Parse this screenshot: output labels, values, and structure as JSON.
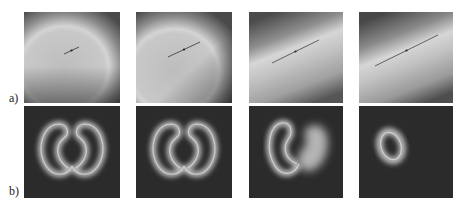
{
  "figure": {
    "rows": [
      {
        "label": "a)",
        "description": "grayscale intensity fields with diagonal bright band and centered line segment",
        "panels": [
          {
            "index": 1,
            "line_length": "short"
          },
          {
            "index": 2,
            "line_length": "medium"
          },
          {
            "index": 3,
            "line_length": "long"
          },
          {
            "index": 4,
            "line_length": "longest"
          }
        ]
      },
      {
        "label": "b)",
        "description": "glowing ring shapes on dark background evolving from double-lobed heart to single ring",
        "panels": [
          {
            "index": 1,
            "shape": "two-lobed ring"
          },
          {
            "index": 2,
            "shape": "two-lobed ring"
          },
          {
            "index": 3,
            "shape": "ring with filled lobe"
          },
          {
            "index": 4,
            "shape": "single oval ring"
          }
        ]
      }
    ]
  }
}
